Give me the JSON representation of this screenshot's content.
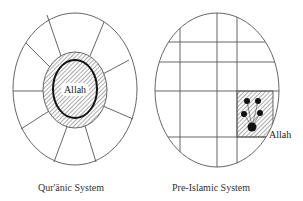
{
  "colors": {
    "stroke": "#555555",
    "bold_stroke": "#111111",
    "hatch": "#666666",
    "dot": "#111111",
    "background": "#ffffff"
  },
  "left_diagram": {
    "caption": "Qur'ānic System",
    "center_label": "Allah",
    "outer_ellipse": {
      "cx": 75,
      "cy": 89,
      "rx": 62,
      "ry": 76
    },
    "shaded_ring": {
      "cx": 75,
      "cy": 90,
      "rx": 32,
      "ry": 38
    },
    "inner_bold_ellipse": {
      "cx": 75,
      "cy": 89,
      "rx": 22,
      "ry": 29
    },
    "spokes": [
      [
        47,
        15,
        61,
        56
      ],
      [
        104,
        22,
        90,
        56
      ],
      [
        26,
        43,
        52,
        69
      ],
      [
        129,
        60,
        101,
        75
      ],
      [
        13,
        91,
        43,
        91
      ],
      [
        21,
        129,
        49,
        111
      ],
      [
        133,
        119,
        103,
        106
      ],
      [
        54,
        162,
        68,
        124
      ],
      [
        96,
        162,
        85,
        126
      ]
    ]
  },
  "right_diagram": {
    "caption": "Pre-Islamic System",
    "side_label": "Allah",
    "outer_ellipse": {
      "cx": 217,
      "cy": 90,
      "rx": 62,
      "ry": 77
    },
    "vertical_lines_x": [
      180,
      217,
      237
    ],
    "horizontal_lines_y": [
      42,
      62,
      91,
      137
    ],
    "shaded_cell": {
      "x": 237,
      "y": 91,
      "w": 36,
      "h": 46
    },
    "dots": [
      {
        "cx": 247,
        "cy": 101,
        "r": 3
      },
      {
        "cx": 258,
        "cy": 101,
        "r": 3
      },
      {
        "cx": 244,
        "cy": 114,
        "r": 3
      },
      {
        "cx": 260,
        "cy": 113,
        "r": 3
      },
      {
        "cx": 252,
        "cy": 127,
        "r": 4.5
      }
    ]
  }
}
